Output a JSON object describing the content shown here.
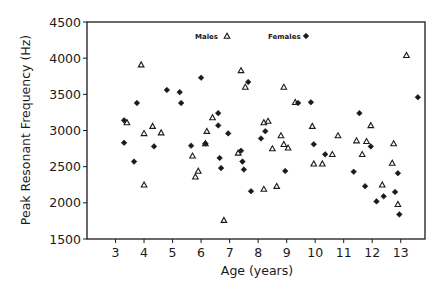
{
  "chart_data": {
    "type": "scatter",
    "title": "",
    "xlabel": "Age (years)",
    "ylabel": "Peak Resonant Frequency (Hz)",
    "xlim": [
      2.0,
      13.85
    ],
    "ylim": [
      1500,
      4500
    ],
    "xticks": [
      3,
      4,
      5,
      6,
      7,
      8,
      9,
      10,
      11,
      12,
      13
    ],
    "yticks": [
      1500,
      2000,
      2500,
      3000,
      3500,
      4000,
      4500
    ],
    "grid": false,
    "legend_position": "top-inside",
    "colors": {
      "ink": "#1a1a1a",
      "background": "#ffffff"
    },
    "series": [
      {
        "name": "Males",
        "marker": "triangle-open",
        "x": [
          3.4,
          3.9,
          4.0,
          4.0,
          4.3,
          4.6,
          5.7,
          5.9,
          5.8,
          6.15,
          6.2,
          6.4,
          6.8,
          7.3,
          7.4,
          7.55,
          8.2,
          8.35,
          8.2,
          8.5,
          8.65,
          8.8,
          8.9,
          8.9,
          9.05,
          9.3,
          9.9,
          9.95,
          10.25,
          10.6,
          10.8,
          11.45,
          11.65,
          11.8,
          11.95,
          12.35,
          12.7,
          12.75,
          12.9,
          13.2
        ],
        "y": [
          3110,
          3910,
          2960,
          2250,
          3060,
          2970,
          2650,
          2440,
          2360,
          2820,
          2990,
          3180,
          1760,
          2690,
          3830,
          3600,
          3110,
          3130,
          2190,
          2750,
          2230,
          2930,
          3600,
          2810,
          2760,
          3390,
          3060,
          2540,
          2540,
          2670,
          2930,
          2860,
          2670,
          2850,
          3070,
          2250,
          2550,
          2820,
          1980,
          4040
        ]
      },
      {
        "name": "Females",
        "marker": "diamond-filled",
        "x": [
          3.3,
          3.3,
          3.65,
          3.75,
          4.35,
          4.8,
          5.25,
          5.3,
          5.65,
          6.0,
          6.15,
          6.6,
          6.6,
          6.65,
          6.7,
          6.95,
          7.4,
          7.45,
          7.5,
          7.65,
          7.75,
          8.1,
          8.25,
          8.95,
          9.4,
          9.85,
          9.95,
          10.35,
          11.35,
          11.55,
          11.75,
          11.95,
          12.15,
          12.4,
          12.8,
          12.9,
          12.95,
          13.6
        ],
        "y": [
          3140,
          2830,
          2570,
          3380,
          2780,
          3560,
          3530,
          3380,
          2790,
          3730,
          2820,
          3240,
          3070,
          2620,
          2480,
          2960,
          2720,
          2570,
          2460,
          3670,
          2160,
          2890,
          2990,
          2440,
          3380,
          3390,
          2810,
          2670,
          2430,
          3240,
          2230,
          2780,
          2020,
          2090,
          2150,
          2410,
          1840,
          3460
        ]
      }
    ],
    "legend": [
      {
        "label": "Males",
        "marker": "triangle-open"
      },
      {
        "label": "Females",
        "marker": "diamond-filled"
      }
    ]
  }
}
